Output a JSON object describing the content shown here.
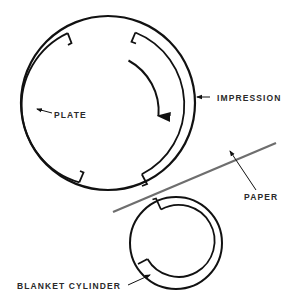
{
  "diagram": {
    "type": "offset printing cylinders",
    "labels": {
      "plate": "PLATE",
      "impression": "IMPRESSION",
      "paper": "PAPER",
      "blanket": "BLANKET CYLINDER"
    },
    "colors": {
      "stroke": "#111111",
      "paper": "#6e6e6e",
      "text": "#2a2a2a",
      "background": "#ffffff"
    },
    "rotation_direction": "clockwise"
  }
}
